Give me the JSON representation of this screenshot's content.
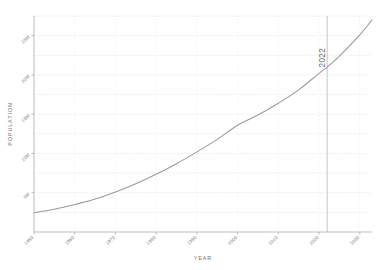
{
  "chart_data": {
    "type": "line",
    "title": "",
    "xlabel": "YEAR",
    "ylabel": "POPULATION",
    "xlim": [
      1950,
      2033
    ],
    "ylim": [
      0,
      27500000
    ],
    "grid": true,
    "legend": null,
    "x_tick_labels": [
      "1950",
      "1960",
      "1970",
      "1980",
      "1990",
      "2000",
      "2010",
      "2020",
      "2030"
    ],
    "x_ticks": [
      1950,
      1960,
      1970,
      1980,
      1990,
      2000,
      2010,
      2020,
      2030
    ],
    "y_tick_labels": [
      "5M",
      "10M",
      "15M",
      "20M",
      "25M"
    ],
    "y_ticks": [
      5000000,
      10000000,
      15000000,
      20000000,
      25000000
    ],
    "annotations": [
      {
        "name": "reference-line-2022",
        "label": "2022",
        "x": 2022,
        "orientation": "vertical"
      }
    ],
    "series": [
      {
        "name": "Population",
        "color": "#9a9a9a",
        "x": [
          1950,
          1955,
          1960,
          1965,
          1970,
          1975,
          1980,
          1985,
          1990,
          1995,
          2000,
          2005,
          2010,
          2015,
          2020,
          2022,
          2025,
          2030,
          2033
        ],
        "values": [
          2450000,
          2900000,
          3500000,
          4200000,
          5100000,
          6150000,
          7350000,
          8700000,
          10200000,
          11800000,
          13600000,
          14900000,
          16400000,
          18100000,
          20200000,
          21000000,
          22400000,
          25100000,
          27000000
        ]
      }
    ]
  },
  "axis": {
    "xlabel": "YEAR",
    "ylabel": "POPULATION"
  }
}
